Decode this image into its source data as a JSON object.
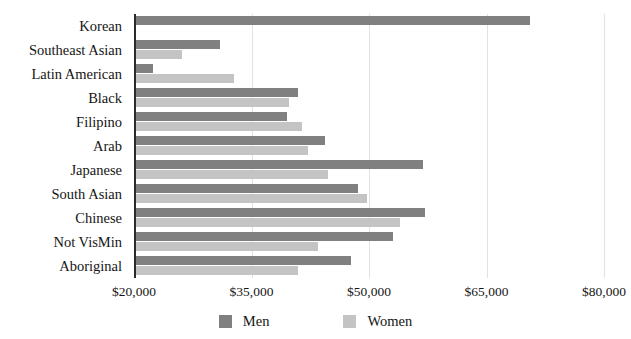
{
  "chart_data": {
    "type": "bar",
    "orientation": "horizontal",
    "title": "",
    "subtitle": "",
    "xlabel": "",
    "ylabel": "",
    "xlim": [
      20000,
      80000
    ],
    "xticks": [
      "$20,000",
      "$35,000",
      "$50,000",
      "$65,000",
      "$80,000"
    ],
    "xtick_values": [
      20000,
      35000,
      50000,
      65000,
      80000
    ],
    "grid": true,
    "legend_position": "bottom",
    "categories": [
      "Korean",
      "Southeast Asian",
      "Latin American",
      "Black",
      "Filipino",
      "Arab",
      "Japanese",
      "South Asian",
      "Chinese",
      "Not VisMin",
      "Aboriginal"
    ],
    "series": [
      {
        "name": "Men",
        "color": "#808080",
        "values": [
          70400,
          30800,
          22200,
          40700,
          39300,
          44200,
          56700,
          48400,
          57000,
          52800,
          47500
        ]
      },
      {
        "name": "Women",
        "color": "#c4c4c4",
        "values": [
          20000,
          25900,
          32600,
          39600,
          41200,
          42000,
          44600,
          49500,
          53800,
          43300,
          40700
        ]
      }
    ]
  },
  "legend": {
    "items": [
      {
        "label": "Men",
        "swatch": "men"
      },
      {
        "label": "Women",
        "swatch": "women"
      }
    ]
  }
}
